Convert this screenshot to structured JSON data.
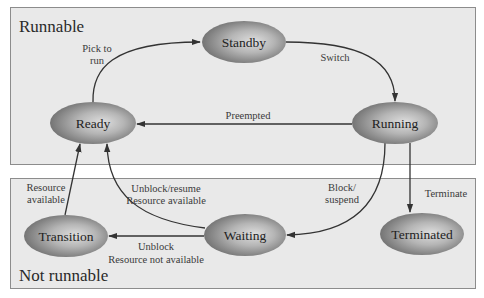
{
  "diagram": {
    "regions": [
      {
        "id": "runnable",
        "title": "Runnable"
      },
      {
        "id": "not-runnable",
        "title": "Not runnable"
      }
    ],
    "states": {
      "standby": "Standby",
      "ready": "Ready",
      "running": "Running",
      "transition": "Transition",
      "waiting": "Waiting",
      "terminated": "Terminated"
    },
    "transitions": {
      "pick_to_run": {
        "from": "Ready",
        "to": "Standby",
        "line1": "Pick to",
        "line2": "run"
      },
      "switch": {
        "from": "Standby",
        "to": "Running",
        "line1": "Switch"
      },
      "preempted": {
        "from": "Running",
        "to": "Ready",
        "line1": "Preempted"
      },
      "block_suspend": {
        "from": "Running",
        "to": "Waiting",
        "line1": "Block/",
        "line2": "suspend"
      },
      "terminate": {
        "from": "Running",
        "to": "Terminated",
        "line1": "Terminate"
      },
      "unblock_resume": {
        "from": "Waiting",
        "to": "Ready",
        "line1": "Unblock/resume",
        "line2": "Resource available"
      },
      "unblock_not_available": {
        "from": "Waiting",
        "to": "Transition",
        "line1": "Unblock",
        "line2": "Resource not available"
      },
      "resource_available": {
        "from": "Transition",
        "to": "Ready",
        "line1": "Resource",
        "line2": "available"
      }
    },
    "colors": {
      "region_fill": "#e9e9e9",
      "region_border": "#8c8c8c",
      "state_light": "#d6d6d6",
      "state_dark": "#6e6e6e",
      "edge": "#333333"
    }
  }
}
